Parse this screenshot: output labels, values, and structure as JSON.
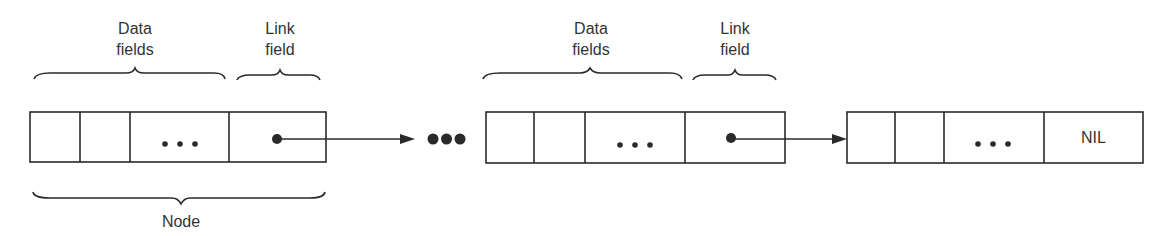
{
  "labels": {
    "data_fields": "Data\nfields",
    "data_fields_line1": "Data",
    "data_fields_line2": "fields",
    "link_field_line1": "Link",
    "link_field_line2": "field",
    "node": "Node",
    "nil": "NIL"
  },
  "nodes": [
    {
      "id": "node-1",
      "data_cells": [
        "",
        "",
        "..."
      ],
      "link": "pointer"
    },
    {
      "id": "node-2",
      "data_cells": [
        "",
        "",
        "..."
      ],
      "link": "pointer"
    },
    {
      "id": "node-3",
      "data_cells": [
        "",
        "",
        "..."
      ],
      "link": "NIL"
    }
  ],
  "ellipsis_between_nodes": "•••",
  "colors": {
    "line": "#2a2a2a",
    "background": "#ffffff"
  }
}
